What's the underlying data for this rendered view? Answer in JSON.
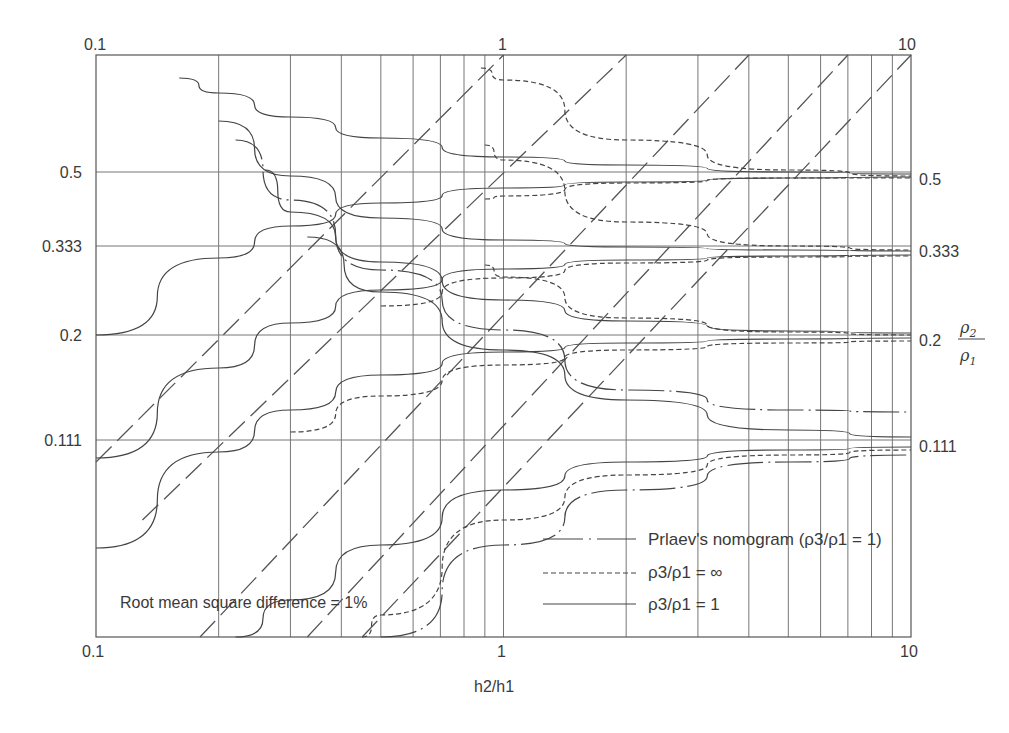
{
  "chart_data": {
    "type": "line",
    "title": "",
    "xlabel": "h2/h1",
    "ylabel": "ρ2/ρ1",
    "xscale": "log",
    "xlim": [
      0.1,
      10
    ],
    "grid": true,
    "x_ticks_bottom": [
      "0.1",
      "1",
      "10"
    ],
    "x_ticks_top": [
      "0.1",
      "1",
      "10"
    ],
    "y_ticks_left": [
      "0.5",
      "0.333",
      "0.2",
      "0.111"
    ],
    "y_ticks_right": [
      "0.5",
      "0.333",
      "0.2",
      "0.111"
    ],
    "y_tick_values": [
      0.5,
      0.333,
      0.2,
      0.111
    ],
    "annotation": "Root mean square difference = 1%",
    "legend": {
      "position": "lower right",
      "entries": [
        {
          "style": "dash-dot",
          "label": "Prlaev's nomogram (ρ3/ρ1 = 1)"
        },
        {
          "style": "dashed",
          "label": "ρ3/ρ1 = ∞"
        },
        {
          "style": "solid",
          "label": "ρ3/ρ1 = 1"
        }
      ]
    },
    "series_note": "Curve families converge asymptotically to ρ2/ρ1 levels 0.5, 0.333, 0.2, 0.111 as h2/h1 increases; long-dash diagonal lines are constant-RMS-difference (1%) isolines. Curve shapes are approximate, not measured.",
    "series": [
      {
        "name": "ρ3/ρ1 = 1 (descending, 0.5)",
        "style": "solid",
        "x": [
          0.16,
          0.2,
          0.3,
          0.5,
          1,
          2,
          5,
          10
        ],
        "y_px": [
          78,
          93,
          117,
          138,
          157,
          165,
          172,
          174
        ]
      },
      {
        "name": "ρ3/ρ1 = 1 (ascending, 0.5)",
        "style": "solid",
        "x": [
          0.1,
          0.2,
          0.3,
          0.5,
          1,
          2,
          5,
          10
        ],
        "y_px": [
          335,
          258,
          226,
          203,
          188,
          182,
          178,
          177
        ]
      },
      {
        "name": "ρ3/ρ1 = ∞ (descending, 0.5)",
        "style": "dashed",
        "x": [
          0.88,
          1,
          2,
          5,
          10
        ],
        "y_px": [
          68,
          80,
          140,
          170,
          176
        ]
      },
      {
        "name": "ρ3/ρ1 = ∞ (ascending, 0.5)",
        "style": "dashed",
        "x": [
          0.9,
          1,
          2,
          5,
          10
        ],
        "y_px": [
          199,
          196,
          183,
          178,
          178
        ]
      },
      {
        "name": "ρ3/ρ1 = 1 (descending, 0.333)",
        "style": "solid",
        "x": [
          0.2,
          0.3,
          0.5,
          1,
          2,
          5,
          10
        ],
        "y_px": [
          121,
          176,
          218,
          240,
          247,
          250,
          251
        ]
      },
      {
        "name": "ρ3/ρ1 = 1 (ascending, 0.333)",
        "style": "solid",
        "x": [
          0.1,
          0.2,
          0.3,
          0.5,
          1,
          2,
          5,
          10
        ],
        "y_px": [
          458,
          368,
          323,
          290,
          269,
          260,
          256,
          255
        ]
      },
      {
        "name": "ρ3/ρ1 = ∞ (descending, 0.333)",
        "style": "dashed",
        "x": [
          0.9,
          1,
          2,
          5,
          10
        ],
        "y_px": [
          145,
          160,
          222,
          246,
          250
        ]
      },
      {
        "name": "ρ3/ρ1 = ∞ (ascending, 0.333)",
        "style": "dashed",
        "x": [
          0.5,
          1,
          2,
          5,
          10
        ],
        "y_px": [
          306,
          278,
          263,
          257,
          256
        ]
      },
      {
        "name": "ρ3/ρ1 = 1 (descending, 0.2)",
        "style": "solid",
        "x": [
          0.26,
          0.3,
          0.5,
          1,
          2,
          5,
          10
        ],
        "y_px": [
          170,
          212,
          262,
          300,
          321,
          331,
          333
        ]
      },
      {
        "name": "ρ3/ρ1 = 1 (ascending, 0.2)",
        "style": "solid",
        "x": [
          0.1,
          0.2,
          0.3,
          0.5,
          1,
          2,
          5,
          10
        ],
        "y_px": [
          548,
          452,
          410,
          375,
          352,
          343,
          339,
          338
        ]
      },
      {
        "name": "ρ3/ρ1 = ∞ (descending, 0.2)",
        "style": "dashed",
        "x": [
          0.9,
          1,
          2,
          5,
          10
        ],
        "y_px": [
          265,
          277,
          318,
          332,
          335
        ]
      },
      {
        "name": "ρ3/ρ1 = ∞ (ascending, 0.2)",
        "style": "dashed",
        "x": [
          0.3,
          0.5,
          1,
          2,
          5,
          10
        ],
        "y_px": [
          432,
          396,
          365,
          350,
          343,
          341
        ]
      },
      {
        "name": "Prlaev (descending, 0.2)",
        "style": "dash-dot",
        "x": [
          0.22,
          0.3,
          0.5,
          1,
          2,
          5,
          10
        ],
        "y_px": [
          140,
          200,
          270,
          330,
          390,
          410,
          412
        ]
      },
      {
        "name": "ρ3/ρ1 = 1 (descending, 0.111)",
        "style": "solid",
        "x": [
          0.33,
          0.5,
          1,
          2,
          5,
          10
        ],
        "y_px": [
          237,
          292,
          350,
          400,
          430,
          437
        ]
      },
      {
        "name": "ρ3/ρ1 = 1 (ascending, 0.111)",
        "style": "solid",
        "x": [
          0.22,
          0.3,
          0.5,
          1,
          2,
          5,
          10
        ],
        "y_px": [
          637,
          600,
          545,
          490,
          462,
          450,
          447
        ]
      },
      {
        "name": "ρ3/ρ1 = ∞ (ascending, 0.111)",
        "style": "dashed",
        "x": [
          0.45,
          0.5,
          1,
          2,
          5,
          10
        ],
        "y_px": [
          637,
          615,
          520,
          475,
          455,
          450
        ]
      },
      {
        "name": "Prlaev (ascending, 0.111)",
        "style": "dash-dot",
        "x": [
          0.5,
          1,
          2,
          5,
          10
        ],
        "y_px": [
          637,
          545,
          490,
          462,
          455
        ]
      }
    ],
    "rms_isolines": [
      {
        "from": [
          0.1,
          462
        ],
        "to": [
          1,
          55
        ]
      },
      {
        "from": [
          0.13,
          520
        ],
        "to": [
          2,
          55
        ]
      },
      {
        "from": [
          0.18,
          637
        ],
        "to": [
          4,
          55
        ]
      },
      {
        "from": [
          0.33,
          637
        ],
        "to": [
          7,
          55
        ]
      },
      {
        "from": [
          0.45,
          637
        ],
        "to": [
          10,
          55
        ]
      }
    ]
  }
}
